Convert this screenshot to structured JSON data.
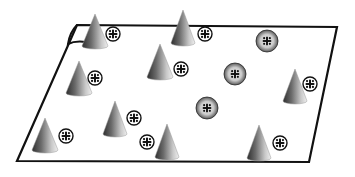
{
  "diagram": {
    "title": "",
    "colors": {
      "background": "#ffffff",
      "outline": "#111111",
      "cone_light": "#e6e6e6",
      "cone_dark": "#3a3a3a",
      "sphere_light": "#f2f2f2",
      "sphere_dark": "#3c3c3c",
      "charge_fill": "#ffffff",
      "charge_mark": "#111111"
    },
    "elements": {
      "plane": {
        "type": "surface",
        "label": ""
      },
      "cones": [
        {
          "id": "cone-1",
          "type": "cone"
        },
        {
          "id": "cone-2",
          "type": "cone"
        },
        {
          "id": "cone-3",
          "type": "cone"
        },
        {
          "id": "cone-4",
          "type": "cone"
        },
        {
          "id": "cone-5",
          "type": "cone"
        },
        {
          "id": "cone-6",
          "type": "cone"
        },
        {
          "id": "cone-7",
          "type": "cone"
        },
        {
          "id": "cone-8",
          "type": "cone"
        },
        {
          "id": "cone-9",
          "type": "cone"
        }
      ],
      "charges": [
        {
          "id": "charge-1",
          "symbol": "+"
        },
        {
          "id": "charge-2",
          "symbol": "+"
        },
        {
          "id": "charge-3",
          "symbol": "+"
        },
        {
          "id": "charge-4",
          "symbol": "+"
        },
        {
          "id": "charge-5",
          "symbol": "+"
        },
        {
          "id": "charge-6",
          "symbol": "+"
        },
        {
          "id": "charge-7",
          "symbol": "+"
        },
        {
          "id": "charge-8",
          "symbol": "+"
        },
        {
          "id": "charge-9",
          "symbol": "+"
        }
      ],
      "spheres": [
        {
          "id": "sphere-1",
          "symbol": "+"
        },
        {
          "id": "sphere-2",
          "symbol": "+"
        },
        {
          "id": "sphere-3",
          "symbol": "+"
        }
      ]
    }
  }
}
